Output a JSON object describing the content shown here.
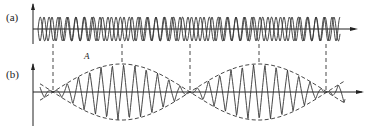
{
  "figure": {
    "panels": [
      {
        "id": "a",
        "label": "(a)",
        "description": "Two superimposed sinusoids of slightly different frequency"
      },
      {
        "id": "b",
        "label": "(b)",
        "description": "Resulting beat signal with dashed amplitude envelope",
        "envelope_label": "A"
      }
    ],
    "colors": {
      "line": "#333333",
      "axis": "#222222",
      "background": "#ffffff"
    }
  }
}
